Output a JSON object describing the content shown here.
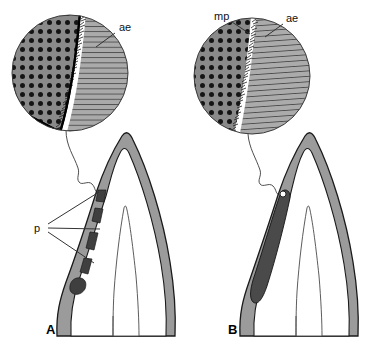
{
  "figure": {
    "background_color": "#ffffff",
    "width": 371,
    "height": 362
  },
  "colors": {
    "stipple_fill": "#8a8a8a",
    "stipple_dot": "#111111",
    "hatch_fill": "#a9a9a9",
    "hatch_line": "#4a4a4a",
    "tooth_enamel_gray": "#9b9b9b",
    "tooth_interior_white": "#ffffff",
    "patch_dark": "#454545",
    "outline": "#000000",
    "leader_line": "#333333",
    "gap_white": "#ffffff"
  },
  "panels": [
    {
      "id": "A",
      "letter": "A",
      "letter_x": 46,
      "letter_y": 334,
      "inset": {
        "name": "inset-circle-a",
        "cx": 70,
        "cy": 73,
        "r": 58,
        "has_open_sector": true,
        "regions": [
          {
            "name": "stipple-zone",
            "label_key": null,
            "pattern": "stipple"
          },
          {
            "name": "gap-zone",
            "label_key": null,
            "pattern": "white"
          },
          {
            "name": "hatch-zone",
            "label_key": "ae",
            "pattern": "hatch"
          }
        ]
      },
      "labels": [
        {
          "key": "ae",
          "text": "ae",
          "x": 119,
          "y": 31,
          "leader_from": [
            114,
            33
          ],
          "leader_to": [
            96,
            46
          ]
        },
        {
          "key": "p",
          "text": "p",
          "x": 37,
          "y": 229,
          "leaders": [
            [
              [
                48,
                225
              ],
              [
                98,
                192
              ]
            ],
            [
              [
                48,
                228
              ],
              [
                100,
                228
              ]
            ],
            [
              [
                48,
                232
              ],
              [
                95,
                262
              ]
            ]
          ]
        }
      ],
      "patches": [
        {
          "name": "pore-patch",
          "index": 0
        },
        {
          "name": "pore-patch",
          "index": 1
        },
        {
          "name": "pore-patch",
          "index": 2
        },
        {
          "name": "pore-patch",
          "index": 3
        },
        {
          "name": "pore-patch",
          "index": 4
        }
      ],
      "patch_style": "segmented"
    },
    {
      "id": "B",
      "letter": "B",
      "letter_x": 228,
      "letter_y": 334,
      "inset": {
        "name": "inset-circle-b",
        "cx": 252,
        "cy": 76,
        "r": 58,
        "has_open_sector": false,
        "regions": [
          {
            "name": "stipple-zone",
            "label_key": "mp",
            "pattern": "stipple"
          },
          {
            "name": "gap-zone",
            "label_key": "mp",
            "pattern": "white"
          },
          {
            "name": "hatch-zone",
            "label_key": "ae",
            "pattern": "hatch"
          }
        ]
      },
      "labels": [
        {
          "key": "mp",
          "text": "mp",
          "x": 216,
          "y": 19,
          "leader_from": [
            232,
            22
          ],
          "leader_to": [
            250,
            33
          ]
        },
        {
          "key": "ae",
          "text": "ae",
          "x": 286,
          "y": 21,
          "leader_from": [
            283,
            24
          ],
          "leader_to": [
            266,
            36
          ]
        }
      ],
      "patch_style": "continuous"
    }
  ],
  "legend_keys": [
    {
      "abbrev": "ae",
      "meaning": "ae"
    },
    {
      "abbrev": "mp",
      "meaning": "mp"
    },
    {
      "abbrev": "p",
      "meaning": "p"
    }
  ]
}
